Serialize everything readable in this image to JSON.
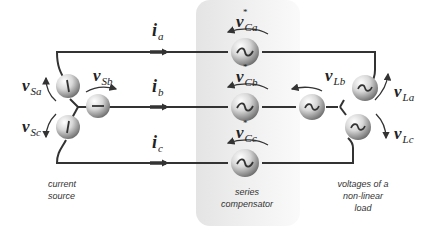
{
  "diagram": {
    "type": "three-phase series compensator circuit",
    "currents": {
      "a": {
        "symbol": "i",
        "sub": "a"
      },
      "b": {
        "symbol": "i",
        "sub": "b"
      },
      "c": {
        "symbol": "i",
        "sub": "c"
      }
    },
    "source_voltages": {
      "a": {
        "symbol": "v",
        "sub": "Sa"
      },
      "b": {
        "symbol": "v",
        "sub": "Sb"
      },
      "c": {
        "symbol": "v",
        "sub": "Sc"
      }
    },
    "compensator_voltages": {
      "a": {
        "symbol": "v",
        "sub": "Ca",
        "mark": "*"
      },
      "b": {
        "symbol": "v",
        "sub": "Cb",
        "mark": "*"
      },
      "c": {
        "symbol": "v",
        "sub": "Cc",
        "mark": "*"
      }
    },
    "load_voltages": {
      "a": {
        "symbol": "v",
        "sub": "La"
      },
      "b": {
        "symbol": "v",
        "sub": "Lb"
      },
      "c": {
        "symbol": "v",
        "sub": "Lc"
      }
    },
    "captions": {
      "source": [
        "current",
        "source"
      ],
      "compensator": [
        "series",
        "compensator"
      ],
      "load": [
        "voltages of a",
        "non-linear",
        "load"
      ]
    },
    "colors": {
      "wire": "#333333",
      "shade": "#ececec",
      "source_glyph": "#333333"
    }
  }
}
